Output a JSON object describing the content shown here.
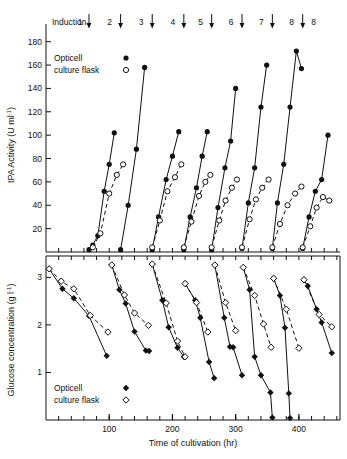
{
  "figure": {
    "background": "#ffffff",
    "ink": "#111111",
    "induction": {
      "prefix_label": "Induction",
      "marks": [
        {
          "label": "1",
          "time": 68
        },
        {
          "label": "2",
          "time": 118
        },
        {
          "label": "3",
          "time": 168
        },
        {
          "label": "4",
          "time": 218
        },
        {
          "label": "5",
          "time": 262
        },
        {
          "label": "6",
          "time": 310
        },
        {
          "label": "7",
          "time": 358
        },
        {
          "label": "8",
          "time": 406
        }
      ]
    }
  },
  "chart_data": [
    {
      "type": "line",
      "id": "tpa-activity",
      "title": "",
      "xlabel": "",
      "ylabel": "tPA Activity (U ml⁻¹)",
      "ylabel_text": "tPA Activity (U ml",
      "ylabel_sup": "-1",
      "ylabel_tail": ")",
      "xlim": [
        0,
        465
      ],
      "ylim": [
        0,
        190
      ],
      "yticks": [
        20,
        40,
        60,
        80,
        100,
        120,
        140,
        160,
        180
      ],
      "ytick_labels": [
        "20",
        "40",
        "60",
        "80",
        "100",
        "120",
        "140",
        "160",
        "180"
      ],
      "xticks_major": [
        100,
        200,
        300,
        400
      ],
      "xtick_minor_step": 20,
      "grid": false,
      "legend_position": "top-left",
      "legend": [
        {
          "name": "Opticell",
          "marker": "filled-circle",
          "line": "solid"
        },
        {
          "name": "culture flask",
          "marker": "open-circle",
          "line": "dashed"
        }
      ],
      "series": [
        {
          "name": "Opticell",
          "marker": "filled-circle",
          "line": "solid",
          "segments": [
            [
              [
                68,
                2
              ],
              [
                74,
                6
              ],
              [
                82,
                14
              ],
              [
                92,
                52
              ],
              [
                100,
                75
              ],
              [
                108,
                102
              ]
            ],
            [
              [
                118,
                2
              ],
              [
                130,
                40
              ],
              [
                143,
                88
              ],
              [
                156,
                158
              ]
            ],
            [
              [
                168,
                2
              ],
              [
                178,
                30
              ],
              [
                190,
                62
              ],
              [
                200,
                82
              ],
              [
                210,
                103
              ]
            ],
            [
              [
                218,
                2
              ],
              [
                228,
                30
              ],
              [
                238,
                55
              ],
              [
                247,
                82
              ],
              [
                255,
                103
              ]
            ],
            [
              [
                262,
                2
              ],
              [
                272,
                38
              ],
              [
                283,
                72
              ],
              [
                292,
                95
              ],
              [
                300,
                140
              ]
            ],
            [
              [
                310,
                3
              ],
              [
                320,
                42
              ],
              [
                330,
                72
              ],
              [
                340,
                124
              ],
              [
                349,
                160
              ]
            ],
            [
              [
                358,
                3
              ],
              [
                366,
                42
              ],
              [
                376,
                75
              ],
              [
                386,
                124
              ],
              [
                396,
                172
              ],
              [
                404,
                157
              ]
            ],
            [
              [
                406,
                3
              ],
              [
                416,
                30
              ],
              [
                426,
                52
              ],
              [
                436,
                62
              ],
              [
                446,
                100
              ]
            ]
          ]
        },
        {
          "name": "culture flask",
          "marker": "open-circle",
          "line": "dashed",
          "segments": [
            [
              [
                74,
                4
              ],
              [
                86,
                16
              ],
              [
                100,
                50
              ],
              [
                112,
                66
              ],
              [
                122,
                75
              ]
            ],
            [
              [
                168,
                4
              ],
              [
                180,
                27
              ],
              [
                192,
                52
              ],
              [
                204,
                64
              ],
              [
                214,
                75
              ]
            ],
            [
              [
                218,
                4
              ],
              [
                230,
                26
              ],
              [
                242,
                48
              ],
              [
                252,
                60
              ],
              [
                260,
                66
              ]
            ],
            [
              [
                262,
                4
              ],
              [
                274,
                27
              ],
              [
                284,
                44
              ],
              [
                294,
                55
              ],
              [
                302,
                62
              ]
            ],
            [
              [
                310,
                4
              ],
              [
                322,
                28
              ],
              [
                332,
                45
              ],
              [
                342,
                55
              ],
              [
                352,
                62
              ]
            ],
            [
              [
                358,
                4
              ],
              [
                370,
                24
              ],
              [
                382,
                40
              ],
              [
                394,
                50
              ],
              [
                404,
                56
              ]
            ],
            [
              [
                406,
                4
              ],
              [
                418,
                22
              ],
              [
                428,
                38
              ],
              [
                438,
                47
              ],
              [
                448,
                44
              ]
            ]
          ]
        }
      ]
    },
    {
      "type": "line",
      "id": "glucose-concentration",
      "title": "",
      "xlabel": "Time of cultivation (hr)",
      "ylabel": "Glucose concentration (g l⁻¹)",
      "ylabel_text": "Glucose concentration (g l",
      "ylabel_sup": "-1",
      "ylabel_tail": ")",
      "xlim": [
        0,
        465
      ],
      "ylim": [
        0,
        3.45
      ],
      "yticks": [
        1,
        2,
        3
      ],
      "ytick_labels": [
        "1",
        "2",
        "3"
      ],
      "xticks_major": [
        100,
        200,
        300,
        400
      ],
      "xtick_labels": [
        "100",
        "200",
        "300",
        "400"
      ],
      "xtick_minor_step": 20,
      "grid": false,
      "legend_position": "bottom-left",
      "legend": [
        {
          "name": "Opticell",
          "marker": "filled-diamond",
          "line": "solid"
        },
        {
          "name": "culture flask",
          "marker": "open-diamond",
          "line": "dashed"
        }
      ],
      "series": [
        {
          "name": "Opticell",
          "marker": "filled-diamond",
          "line": "solid",
          "segments": [
            [
              [
                5,
                3.18
              ],
              [
                26,
                2.76
              ],
              [
                44,
                2.56
              ],
              [
                68,
                2.19
              ],
              [
                96,
                1.35
              ]
            ],
            [
              [
                104,
                3.26
              ],
              [
                116,
                2.74
              ],
              [
                126,
                2.45
              ],
              [
                140,
                1.86
              ],
              [
                158,
                1.46
              ],
              [
                163,
                1.45
              ]
            ],
            [
              [
                168,
                3.28
              ],
              [
                184,
                2.52
              ],
              [
                194,
                1.95
              ],
              [
                208,
                1.52
              ],
              [
                218,
                1.33
              ]
            ],
            [
              [
                220,
                2.87
              ],
              [
                236,
                2.52
              ],
              [
                244,
                2.15
              ],
              [
                258,
                1.22
              ],
              [
                266,
                0.88
              ]
            ],
            [
              [
                267,
                3.26
              ],
              [
                282,
                2.15
              ],
              [
                291,
                1.54
              ],
              [
                296,
                1.53
              ],
              [
                310,
                0.94
              ]
            ],
            [
              [
                312,
                3.21
              ],
              [
                322,
                2.74
              ],
              [
                330,
                1.33
              ],
              [
                340,
                0.94
              ],
              [
                355,
                0.58
              ],
              [
                358,
                0.05
              ]
            ],
            [
              [
                360,
                2.98
              ],
              [
                370,
                2.62
              ],
              [
                378,
                1.94
              ],
              [
                384,
                0.56
              ],
              [
                386,
                0.04
              ]
            ],
            [
              [
                408,
                2.95
              ],
              [
                414,
                2.82
              ],
              [
                428,
                2.33
              ],
              [
                436,
                2.05
              ],
              [
                452,
                1.41
              ]
            ]
          ]
        },
        {
          "name": "culture flask",
          "marker": "open-diamond",
          "line": "dashed",
          "segments": [
            [
              [
                5,
                3.18
              ],
              [
                24,
                2.92
              ],
              [
                44,
                2.76
              ],
              [
                70,
                2.2
              ],
              [
                98,
                1.85
              ]
            ],
            [
              [
                104,
                3.26
              ],
              [
                124,
                2.63
              ],
              [
                140,
                2.25
              ],
              [
                162,
                1.99
              ]
            ],
            [
              [
                168,
                3.28
              ],
              [
                190,
                2.46
              ],
              [
                208,
                1.66
              ],
              [
                220,
                1.33
              ]
            ],
            [
              [
                220,
                2.87
              ],
              [
                238,
                2.47
              ],
              [
                256,
                1.85
              ]
            ],
            [
              [
                267,
                3.26
              ],
              [
                284,
                2.47
              ],
              [
                300,
                1.88
              ]
            ],
            [
              [
                312,
                3.21
              ],
              [
                330,
                2.62
              ],
              [
                344,
                2.02
              ],
              [
                356,
                1.53
              ]
            ],
            [
              [
                360,
                2.98
              ],
              [
                380,
                2.33
              ],
              [
                400,
                1.51
              ]
            ],
            [
              [
                408,
                2.95
              ],
              [
                432,
                2.22
              ],
              [
                452,
                1.96
              ]
            ]
          ]
        }
      ]
    }
  ]
}
